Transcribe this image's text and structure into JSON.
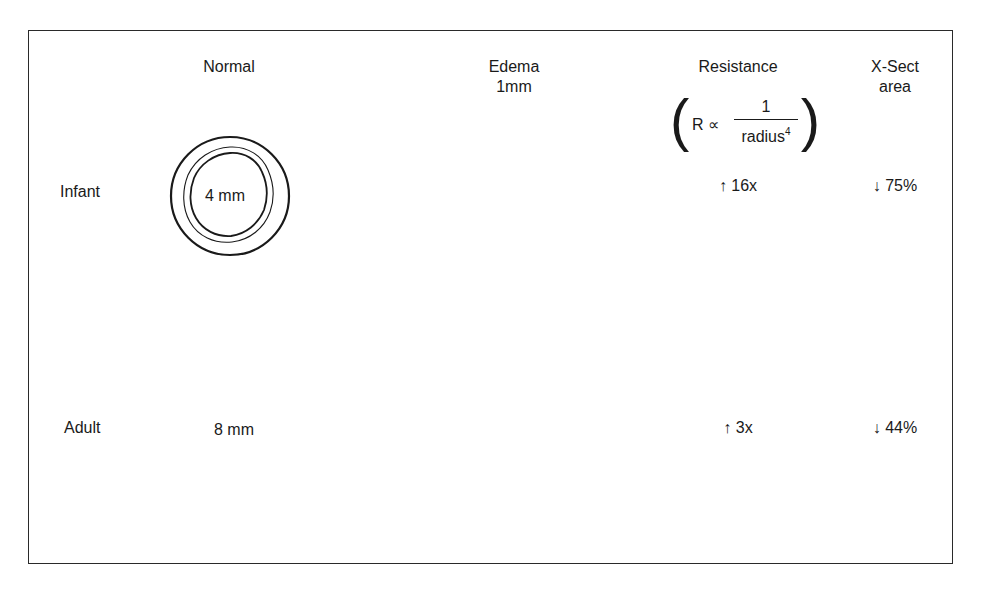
{
  "figure": {
    "columns": {
      "normal": "Normal",
      "edema_line1": "Edema",
      "edema_line2": "1mm",
      "resistance": "Resistance",
      "xsect_line1": "X-Sect",
      "xsect_line2": "area"
    },
    "formula": {
      "lhs": "R ∝",
      "numerator": "1",
      "denominator": "radius",
      "exponent": "4"
    },
    "rows": [
      {
        "label": "Infant",
        "normal_diameter": "4 mm",
        "resistance_change": "↑ 16x",
        "area_change": "↓ 75%"
      },
      {
        "label": "Adult",
        "normal_diameter": "8 mm",
        "resistance_change": "↑ 3x",
        "area_change": "↓ 44%"
      }
    ],
    "colors": {
      "line": "#1a1a1a",
      "background": "#ffffff"
    }
  }
}
